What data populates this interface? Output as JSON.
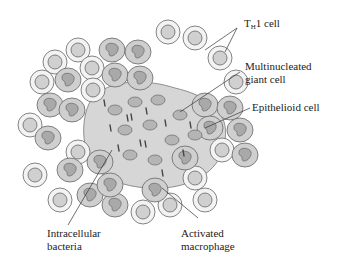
{
  "diagram": {
    "labels": {
      "th1_cell": {
        "main": "T",
        "sub": "H",
        "rest": "1 cell"
      },
      "multinucleated_line1": "Multinucleated",
      "multinucleated_line2": "giant cell",
      "epithelioid": "Epithelioid cell",
      "bacteria_line1": "Intracellular",
      "bacteria_line2": "bacteria",
      "macrophage_line1": "Activated",
      "macrophage_line2": "macrophage"
    },
    "colors": {
      "cell_fill_light": "#f0f0f0",
      "cell_fill_medium": "#d4d4d4",
      "cell_fill_dark": "#bdbdbd",
      "nucleus_fill": "#a8a8a8",
      "outline": "#555555",
      "leader_line": "#333333"
    }
  }
}
